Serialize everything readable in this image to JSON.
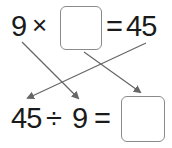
{
  "top_equation": {
    "left_operand": "9",
    "operator": "×",
    "blank": "",
    "equals": "=",
    "result": "45"
  },
  "bottom_equation": {
    "dividend": "45",
    "operator": "÷",
    "divisor": "9",
    "equals": "=",
    "blank": ""
  },
  "arrows": [
    {
      "from": "top 9",
      "to": "bottom 9"
    },
    {
      "from": "top blank box",
      "to": "bottom blank box"
    },
    {
      "from": "top 45",
      "to": "bottom 45"
    }
  ],
  "colors": {
    "text": "#1a1a1a",
    "arrow": "#666666",
    "box_border": "#8a8a8a"
  }
}
